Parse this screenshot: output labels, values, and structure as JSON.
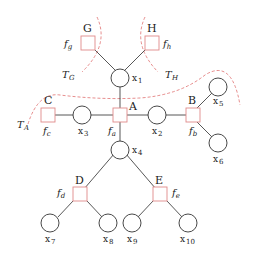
{
  "diagram": {
    "type": "factor-graph",
    "factors": [
      {
        "id": "A",
        "label": "A",
        "fn": "f",
        "sub": "a"
      },
      {
        "id": "B",
        "label": "B",
        "fn": "f",
        "sub": "b"
      },
      {
        "id": "C",
        "label": "C",
        "fn": "f",
        "sub": "c"
      },
      {
        "id": "D",
        "label": "D",
        "fn": "f",
        "sub": "d"
      },
      {
        "id": "E",
        "label": "E",
        "fn": "f",
        "sub": "e"
      },
      {
        "id": "G",
        "label": "G",
        "fn": "f",
        "sub": "g"
      },
      {
        "id": "H",
        "label": "H",
        "fn": "f",
        "sub": "h"
      }
    ],
    "variables": [
      {
        "id": "x1",
        "base": "x",
        "sub": "1"
      },
      {
        "id": "x2",
        "base": "x",
        "sub": "2"
      },
      {
        "id": "x3",
        "base": "x",
        "sub": "3"
      },
      {
        "id": "x4",
        "base": "x",
        "sub": "4"
      },
      {
        "id": "x5",
        "base": "x",
        "sub": "5"
      },
      {
        "id": "x6",
        "base": "x",
        "sub": "6"
      },
      {
        "id": "x7",
        "base": "x",
        "sub": "7"
      },
      {
        "id": "x8",
        "base": "x",
        "sub": "8"
      },
      {
        "id": "x9",
        "base": "x",
        "sub": "9"
      },
      {
        "id": "x10",
        "base": "x",
        "sub": "10"
      }
    ],
    "edges": [
      [
        "G",
        "x1"
      ],
      [
        "H",
        "x1"
      ],
      [
        "x1",
        "A"
      ],
      [
        "C",
        "x3"
      ],
      [
        "x3",
        "A"
      ],
      [
        "A",
        "x2"
      ],
      [
        "x2",
        "B"
      ],
      [
        "B",
        "x5"
      ],
      [
        "B",
        "x6"
      ],
      [
        "A",
        "x4"
      ],
      [
        "x4",
        "D"
      ],
      [
        "x4",
        "E"
      ],
      [
        "D",
        "x7"
      ],
      [
        "D",
        "x8"
      ],
      [
        "E",
        "x9"
      ],
      [
        "E",
        "x10"
      ]
    ],
    "subtrees": [
      {
        "label": "T",
        "sub": "G"
      },
      {
        "label": "T",
        "sub": "H"
      },
      {
        "label": "T",
        "sub": "A"
      }
    ]
  }
}
